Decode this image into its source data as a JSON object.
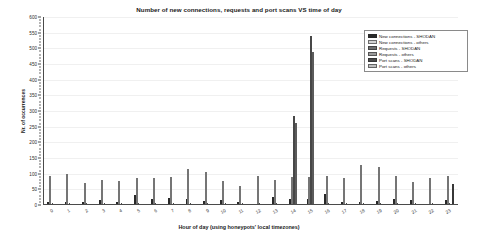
{
  "chart_data": {
    "type": "bar",
    "title": "Number of new connections, requests and port scans VS time of day",
    "xlabel": "Hour of day (using honeypots' local timezones)",
    "ylabel": "Nr. of occurrences",
    "ylim": [
      0,
      600
    ],
    "ytick_step": 50,
    "yticks": [
      0,
      50,
      100,
      150,
      200,
      250,
      300,
      350,
      400,
      450,
      500,
      550,
      600
    ],
    "grid": true,
    "legend_position": "upper right",
    "categories": [
      "0",
      "1",
      "2",
      "3",
      "4",
      "5",
      "6",
      "7",
      "8",
      "9",
      "10",
      "11",
      "12",
      "13",
      "14",
      "15",
      "16",
      "17",
      "18",
      "19",
      "20",
      "21",
      "22",
      "23"
    ],
    "series": [
      {
        "name": "New connections - SHODAN",
        "color": "#2b2b2b",
        "values": [
          2,
          7,
          7,
          14,
          7,
          30,
          15,
          18,
          15,
          9,
          12,
          4,
          0,
          22,
          15,
          15,
          32,
          8,
          5,
          11,
          17,
          12,
          0,
          12
        ]
      },
      {
        "name": "New connections - others",
        "color": "#d2d2d2",
        "values": [
          90,
          96,
          68,
          76,
          75,
          83,
          83,
          85,
          112,
          102,
          73,
          58,
          88,
          76,
          87,
          86,
          90,
          82,
          125,
          118,
          91,
          70,
          82,
          90
        ]
      },
      {
        "name": "Requests - SHODAN",
        "color": "#6e6e6e",
        "values": [
          0,
          0,
          0,
          0,
          0,
          0,
          0,
          0,
          0,
          0,
          0,
          0,
          0,
          0,
          280,
          535,
          0,
          0,
          0,
          0,
          0,
          0,
          0,
          0
        ]
      },
      {
        "name": "Requests - others",
        "color": "#9a9a9a",
        "values": [
          0,
          0,
          0,
          0,
          0,
          0,
          0,
          0,
          0,
          0,
          0,
          0,
          0,
          0,
          258,
          485,
          0,
          0,
          0,
          0,
          0,
          0,
          0,
          0
        ]
      },
      {
        "name": "Port scans - SHODAN",
        "color": "#4a4a4a",
        "values": [
          0,
          0,
          0,
          0,
          0,
          0,
          0,
          0,
          0,
          0,
          0,
          0,
          0,
          0,
          0,
          0,
          0,
          0,
          0,
          0,
          0,
          0,
          0,
          63
        ]
      },
      {
        "name": "Port scans - others",
        "color": "#bfbfbf",
        "values": [
          0,
          0,
          0,
          0,
          0,
          0,
          0,
          0,
          0,
          0,
          0,
          0,
          0,
          0,
          0,
          0,
          0,
          0,
          0,
          0,
          0,
          0,
          0,
          0
        ]
      }
    ]
  },
  "legend": {
    "items": [
      {
        "label": "New connections - SHODAN"
      },
      {
        "label": "New connections - others"
      },
      {
        "label": "Requests - SHODAN"
      },
      {
        "label": "Requests - others"
      },
      {
        "label": "Port scans - SHODAN"
      },
      {
        "label": "Port scans - others"
      }
    ]
  }
}
